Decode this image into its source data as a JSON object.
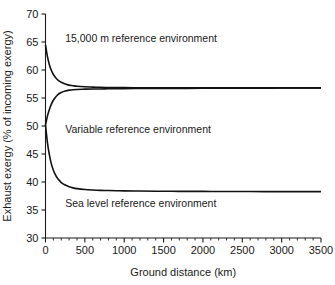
{
  "chart_data": {
    "type": "line",
    "title": "",
    "xlabel": "Ground distance (km)",
    "ylabel": "Exhaust exergy (% of incoming exergy)",
    "xlim": [
      0,
      3500
    ],
    "ylim": [
      30,
      70
    ],
    "xticks": [
      0,
      500,
      1000,
      1500,
      2000,
      2500,
      3000,
      3500
    ],
    "xtick_labels": [
      "0",
      "500",
      "1000",
      "1500",
      "2000",
      "2500",
      "3000",
      "3500"
    ],
    "xminor_step": 100,
    "yticks": [
      30,
      35,
      40,
      45,
      50,
      55,
      60,
      65,
      70
    ],
    "ytick_labels": [
      "30",
      "35",
      "40",
      "45",
      "50",
      "55",
      "60",
      "65",
      "70"
    ],
    "grid": false,
    "legend": "inline-annotations",
    "line_color": "#111111",
    "background": "#ffffff",
    "series": [
      {
        "name": "15,000 m reference environment",
        "annotation": "15,000 m reference environment",
        "annotation_x": 250,
        "annotation_y": 65.6,
        "start_value": 64.5,
        "asymptote": 56.8,
        "x": [
          0,
          25,
          50,
          75,
          100,
          125,
          150,
          175,
          200,
          250,
          300,
          350,
          400,
          500,
          600,
          700,
          800,
          900,
          1000,
          1200,
          1400,
          1600,
          1800,
          2000,
          2200,
          2400,
          2600,
          2800,
          3000,
          3200,
          3500
        ],
        "values": [
          64.5,
          62.4,
          60.9,
          59.9,
          59.2,
          58.7,
          58.3,
          58.0,
          57.8,
          57.5,
          57.3,
          57.2,
          57.1,
          57.0,
          56.95,
          56.9,
          56.88,
          56.86,
          56.85,
          56.84,
          56.83,
          56.82,
          56.82,
          56.81,
          56.81,
          56.8,
          56.8,
          56.8,
          56.8,
          56.8,
          56.8
        ]
      },
      {
        "name": "Variable reference environment",
        "annotation": "Variable reference environment",
        "annotation_x": 250,
        "annotation_y": 49.3,
        "start_value": 50.2,
        "asymptote": 56.6,
        "x": [
          0,
          25,
          50,
          75,
          100,
          125,
          150,
          175,
          200,
          250,
          300,
          350,
          400,
          500,
          600,
          700,
          800,
          900,
          1000,
          1200,
          1400,
          1600,
          1800,
          2000,
          2200,
          2400,
          2600,
          2800,
          3000,
          3200,
          3500
        ],
        "values": [
          50.2,
          51.8,
          53.0,
          53.9,
          54.6,
          55.1,
          55.5,
          55.8,
          56.0,
          56.25,
          56.4,
          56.48,
          56.53,
          56.58,
          56.6,
          56.62,
          56.64,
          56.66,
          56.67,
          56.69,
          56.7,
          56.71,
          56.72,
          56.73,
          56.74,
          56.75,
          56.76,
          56.77,
          56.78,
          56.78,
          56.79
        ]
      },
      {
        "name": "Sea level reference environment",
        "annotation": "Sea level reference environment",
        "annotation_x": 250,
        "annotation_y": 36.2,
        "start_value": 50.2,
        "asymptote": 38.3,
        "x": [
          0,
          25,
          50,
          75,
          100,
          125,
          150,
          175,
          200,
          250,
          300,
          350,
          400,
          500,
          600,
          700,
          800,
          900,
          1000,
          1200,
          1400,
          1600,
          1800,
          2000,
          2200,
          2400,
          2600,
          2800,
          3000,
          3200,
          3500
        ],
        "values": [
          50.2,
          47.0,
          44.8,
          43.2,
          42.1,
          41.3,
          40.7,
          40.3,
          39.9,
          39.45,
          39.15,
          38.95,
          38.82,
          38.66,
          38.57,
          38.51,
          38.47,
          38.44,
          38.42,
          38.38,
          38.36,
          38.34,
          38.33,
          38.32,
          38.31,
          38.3,
          38.3,
          38.29,
          38.29,
          38.28,
          38.28
        ]
      }
    ]
  }
}
